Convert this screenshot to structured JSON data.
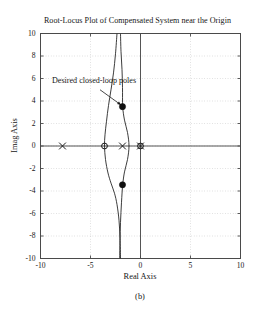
{
  "figure": {
    "caption": "(b)",
    "background_color": "#ffffff"
  },
  "chart_data": {
    "type": "scatter",
    "title": "Root-Locus Plot of Compensated System near the Origin",
    "xlabel": "Real Axis",
    "ylabel": "Imag Axis",
    "xlim": [
      -10,
      10
    ],
    "ylim": [
      -10,
      10
    ],
    "xticks": [
      -10,
      -5,
      0,
      5,
      10
    ],
    "xtick_labels": [
      "-10",
      "-5",
      "0",
      "5",
      "10"
    ],
    "yticks": [
      -10,
      -8,
      -6,
      -4,
      -2,
      0,
      2,
      4,
      6,
      8,
      10
    ],
    "ytick_labels": [
      "-10",
      "-8",
      "-6",
      "-4",
      "-2",
      "0",
      "2",
      "4",
      "6",
      "8",
      "10"
    ],
    "grid": true,
    "grid_style": "dotted",
    "grid_color": "#b8b8b8",
    "axis_color": "#555555",
    "curve_color": "#1a1a1a",
    "legend": null,
    "series": [
      {
        "name": "open-loop poles",
        "marker": "x",
        "values": [
          {
            "x": -7.8,
            "y": 0
          },
          {
            "x": -1.8,
            "y": 0
          },
          {
            "x": 0.0,
            "y": 0
          }
        ]
      },
      {
        "name": "open-loop zeros",
        "marker": "o",
        "values": [
          {
            "x": -3.6,
            "y": 0
          },
          {
            "x": 0.0,
            "y": 0
          }
        ]
      },
      {
        "name": "desired closed-loop poles",
        "marker": "filled-circle",
        "values": [
          {
            "x": -1.8,
            "y": 3.5
          },
          {
            "x": -1.8,
            "y": -3.45
          }
        ]
      }
    ],
    "loci": [
      {
        "name": "branch-left",
        "points": [
          {
            "x": -2.35,
            "y": 10.0
          },
          {
            "x": -2.5,
            "y": 8.2
          },
          {
            "x": -2.7,
            "y": 6.5
          },
          {
            "x": -2.95,
            "y": 5.0
          },
          {
            "x": -3.2,
            "y": 3.6
          },
          {
            "x": -3.4,
            "y": 2.2
          },
          {
            "x": -3.55,
            "y": 1.0
          },
          {
            "x": -3.6,
            "y": 0.0
          },
          {
            "x": -3.5,
            "y": -1.2
          },
          {
            "x": -3.25,
            "y": -2.4
          },
          {
            "x": -2.95,
            "y": -3.3
          },
          {
            "x": -2.6,
            "y": -4.2
          },
          {
            "x": -2.35,
            "y": -5.2
          },
          {
            "x": -2.15,
            "y": -6.6
          },
          {
            "x": -2.05,
            "y": -8.2
          },
          {
            "x": -2.0,
            "y": -10.0
          }
        ]
      },
      {
        "name": "branch-right",
        "points": [
          {
            "x": -2.0,
            "y": 10.0
          },
          {
            "x": -1.95,
            "y": 8.4
          },
          {
            "x": -1.85,
            "y": 6.8
          },
          {
            "x": -1.8,
            "y": 5.2
          },
          {
            "x": -1.78,
            "y": 3.5
          },
          {
            "x": -1.6,
            "y": 2.3
          },
          {
            "x": -1.3,
            "y": 1.2
          },
          {
            "x": -1.15,
            "y": 0.0
          },
          {
            "x": -1.3,
            "y": -1.2
          },
          {
            "x": -1.6,
            "y": -2.3
          },
          {
            "x": -1.78,
            "y": -3.45
          },
          {
            "x": -1.9,
            "y": -5.0
          },
          {
            "x": -2.0,
            "y": -6.8
          },
          {
            "x": -2.05,
            "y": -8.4
          },
          {
            "x": -2.08,
            "y": -10.0
          }
        ]
      }
    ],
    "annotations": [
      {
        "text": "Desired closed-loop poles",
        "text_x": -6.6,
        "text_y": 5.9,
        "arrow_from": {
          "x": -4.05,
          "y": 5.0
        },
        "arrow_to": {
          "x": -1.95,
          "y": 3.65
        }
      }
    ]
  }
}
